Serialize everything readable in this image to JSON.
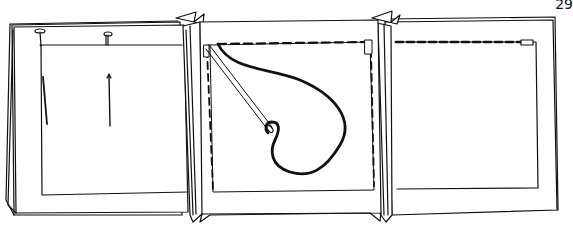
{
  "page": {
    "number": "29",
    "colors": {
      "ink": "#111111",
      "paper": "#ffffff"
    }
  },
  "illustration": {
    "description": "Sewing illustration: three fabric panels; left panel held with two straight pins, center panel shows needle and thread with basting stitches along top and sides, right panel shows basting stitch along top edge",
    "panels": [
      {
        "id": "left",
        "elements": [
          "pin-top-left",
          "pin-top-center",
          "pin-side-left",
          "pin-center"
        ]
      },
      {
        "id": "center",
        "elements": [
          "needle",
          "thread",
          "basting-stitch-top",
          "basting-stitch-left",
          "basting-stitch-right"
        ]
      },
      {
        "id": "right",
        "elements": [
          "basting-stitch-top"
        ]
      }
    ]
  }
}
